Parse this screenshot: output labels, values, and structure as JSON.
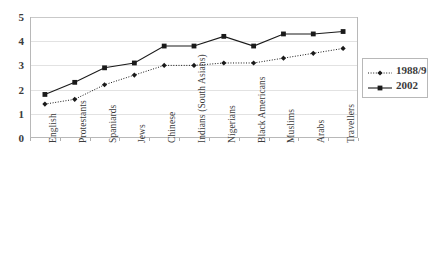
{
  "chart_data": {
    "type": "line",
    "title": "",
    "subtitle": "",
    "xlabel": "",
    "ylabel": "",
    "ylim": [
      0,
      5
    ],
    "yticks": [
      0,
      1,
      2,
      3,
      4,
      5
    ],
    "grid": true,
    "legend_position": "right",
    "categories": [
      "English",
      "Protestants",
      "Spaniards",
      "Jews",
      "Chinese",
      "Indians (South Asians)",
      "Nigerians",
      "Black Americans",
      "Muslims",
      "Arabs",
      "Travellers"
    ],
    "series": [
      {
        "name": "1988/9",
        "marker": "diamond",
        "line_style": "dotted",
        "color": "#1a1a1a",
        "values": [
          1.4,
          1.6,
          2.2,
          2.6,
          3.0,
          3.0,
          3.1,
          3.1,
          3.3,
          3.5,
          3.7
        ]
      },
      {
        "name": "2002",
        "marker": "square",
        "line_style": "solid",
        "color": "#1a1a1a",
        "values": [
          1.8,
          2.3,
          2.9,
          3.1,
          3.8,
          3.8,
          4.2,
          3.8,
          4.3,
          4.3,
          4.4
        ]
      }
    ]
  },
  "legend": {
    "entries": [
      {
        "label": "1988/9"
      },
      {
        "label": "2002"
      }
    ]
  },
  "caption": {
    "text": ""
  }
}
